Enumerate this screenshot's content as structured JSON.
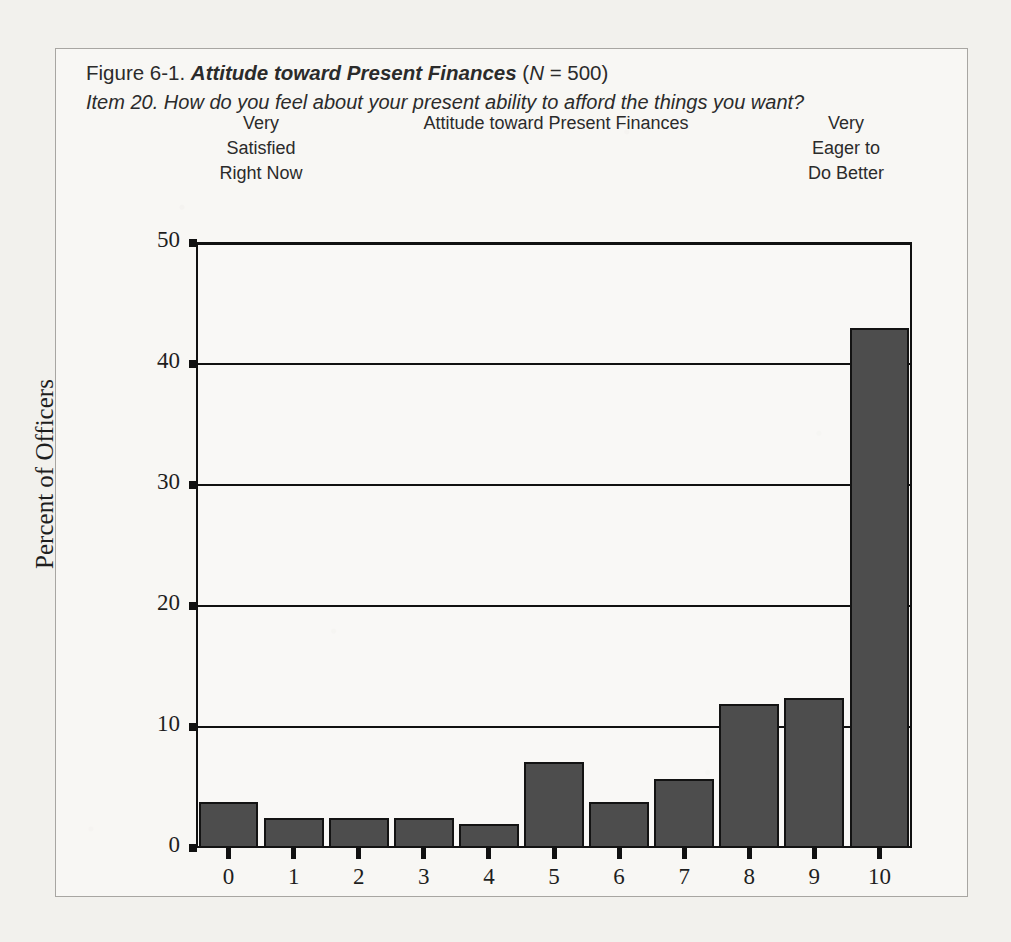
{
  "figure": {
    "caption_prefix": "Figure 6-1. ",
    "caption_title": "Attitude toward Present Finances",
    "caption_n_open": " (",
    "caption_n_symbol": "N",
    "caption_n_value": " = 500)",
    "caption_item": "Item 20. How do you feel about your present ability to afford the things you want?"
  },
  "scale_labels": {
    "left": "Very\nSatisfied\nRight Now",
    "left_line1": "Very",
    "left_line2": "Satisfied",
    "left_line3": "Right Now",
    "center": "Attitude toward Present Finances",
    "right_line1": "Very",
    "right_line2": "Eager to",
    "right_line3": "Do Better"
  },
  "colors": {
    "bar_fill": "#4d4d4d",
    "bar_stroke": "#131313",
    "axis": "#111111",
    "paper": "#f2f1ed",
    "figure_border": "#a8a6a2",
    "text": "#2b2b2b"
  },
  "chart_data": {
    "type": "bar",
    "title": "Attitude toward Present Finances",
    "xlabel": "Attitude toward Present Finances",
    "ylabel": "Percent of Officers",
    "categories": [
      "0",
      "1",
      "2",
      "3",
      "4",
      "5",
      "6",
      "7",
      "8",
      "9",
      "10"
    ],
    "values": [
      3.8,
      2.5,
      2.5,
      2.5,
      2.0,
      7.1,
      3.8,
      5.7,
      11.9,
      12.4,
      43.0
    ],
    "ylim": [
      0,
      50
    ],
    "yticks": [
      0,
      10,
      20,
      30,
      40,
      50
    ],
    "ytick_labels": [
      "0",
      "10",
      "20",
      "30",
      "40",
      "50"
    ],
    "xlim": [
      -0.5,
      10.5
    ],
    "grid": "horizontal",
    "legend": "none",
    "n": 500,
    "units": "percent"
  }
}
